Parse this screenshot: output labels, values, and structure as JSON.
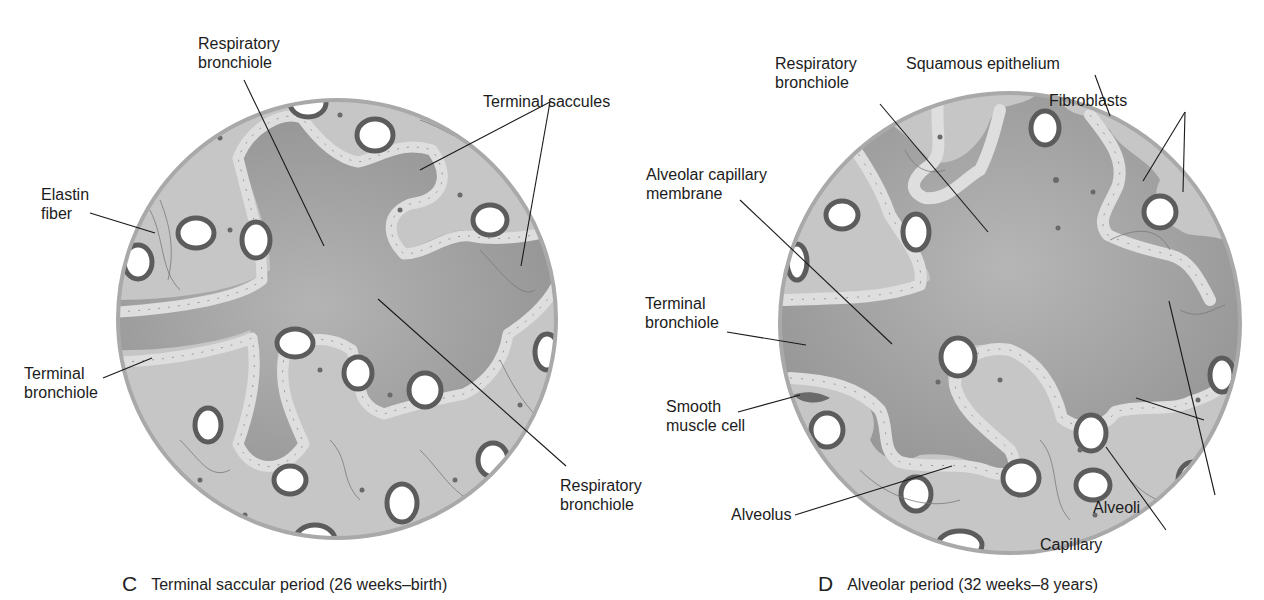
{
  "panels": [
    {
      "id": "C",
      "letter": "C",
      "caption": "Terminal saccular period (26 weeks–birth)",
      "labels": {
        "respiratory_bronchiole_top": [
          "Respiratory",
          "bronchiole"
        ],
        "terminal_saccules": "Terminal saccules",
        "elastin_fiber": [
          "Elastin",
          "fiber"
        ],
        "terminal_bronchiole": [
          "Terminal",
          "bronchiole"
        ],
        "respiratory_bronchiole_bottom": [
          "Respiratory",
          "bronchiole"
        ]
      }
    },
    {
      "id": "D",
      "letter": "D",
      "caption": "Alveolar period (32 weeks–8 years)",
      "labels": {
        "respiratory_bronchiole": [
          "Respiratory",
          "bronchiole"
        ],
        "squamous_epithelium": "Squamous epithelium",
        "fibroblasts": "Fibroblasts",
        "alveolar_capillary_membrane": [
          "Alveolar capillary",
          "membrane"
        ],
        "terminal_bronchiole": [
          "Terminal",
          "bronchiole"
        ],
        "smooth_muscle_cell": [
          "Smooth",
          "muscle cell"
        ],
        "alveolus": "Alveolus",
        "capillary": "Capillary",
        "alveoli": "Alveoli"
      }
    }
  ],
  "colors": {
    "airspace": "#9b9b9b",
    "interstitium": "#c6c6c6",
    "epithelium": "#dedede",
    "rim": "#a9a9a9",
    "capillary_wall": "#5a5a5a",
    "leader_line": "#1a1a1a"
  }
}
